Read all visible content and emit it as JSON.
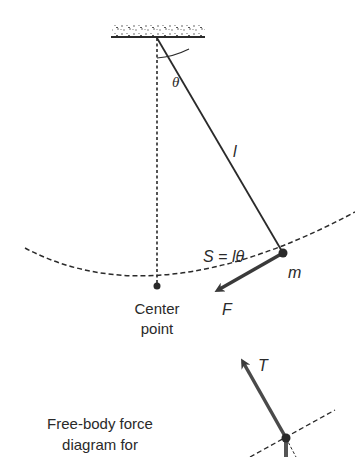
{
  "diagram": {
    "labels": {
      "angle": "θ",
      "length": "l",
      "arc_length": "S = lθ",
      "mass": "m",
      "force": "F",
      "center_line1": "Center",
      "center_line2": "point",
      "tension": "T",
      "fbd_line1": "Free-body force",
      "fbd_line2": "diagram for"
    },
    "colors": {
      "ink": "#2a2a2a",
      "arrow": "#4a4a4a",
      "ceiling_speckle": "#555555"
    }
  }
}
